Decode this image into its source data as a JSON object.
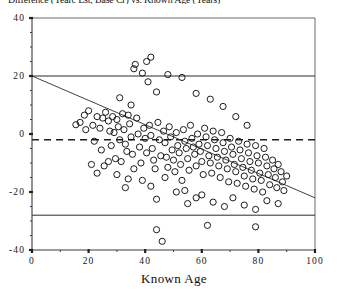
{
  "figure": {
    "clipped_top_title": "Difference (Yearc Est, Base Cr) vs. Known Age (Years)",
    "background": "#ffffff",
    "ink_color": "#111111"
  },
  "chart_data": {
    "type": "scatter",
    "title": "",
    "xlabel": "Known Age",
    "ylabel": "",
    "xlim": [
      0,
      100
    ],
    "xticks": [
      0,
      20,
      40,
      60,
      80,
      100
    ],
    "xtick_labels": [
      "0",
      "20",
      "40",
      "60",
      "80",
      "100"
    ],
    "ylim": [
      -40,
      40
    ],
    "yticks": [
      -40,
      -20,
      0,
      20,
      40
    ],
    "ytick_labels": [
      "-40",
      "-20",
      "0",
      "20",
      "40"
    ],
    "x_minor_tick_step": 10,
    "y_minor_tick_step": 5,
    "grid": false,
    "legend": null,
    "reference_lines": [
      {
        "name": "upper-limit-line",
        "style": "solid",
        "orientation": "horizontal",
        "y": 20
      },
      {
        "name": "mean-bias-line",
        "style": "dashed",
        "orientation": "horizontal",
        "y": -2
      },
      {
        "name": "lower-limit-line",
        "style": "solid",
        "orientation": "horizontal",
        "y": -28
      }
    ],
    "fit_line": {
      "name": "regression-line",
      "style": "solid",
      "x0": 0,
      "y0": 20,
      "x1": 100,
      "y1": -22,
      "slope": -0.42,
      "intercept": 20
    },
    "marker": {
      "shape": "open-circle",
      "radius_px": 3.1
    },
    "n_points": 168,
    "points": [
      [
        15.5,
        3.2
      ],
      [
        17.0,
        4.0
      ],
      [
        18.5,
        6.5
      ],
      [
        19.0,
        1.5
      ],
      [
        20.0,
        8.0
      ],
      [
        21.5,
        3.0
      ],
      [
        22.0,
        -2.5
      ],
      [
        23.0,
        6.0
      ],
      [
        24.0,
        2.0
      ],
      [
        24.5,
        -5.5
      ],
      [
        25.0,
        5.5
      ],
      [
        26.0,
        7.5
      ],
      [
        27.0,
        4.5
      ],
      [
        27.5,
        1.0
      ],
      [
        28.0,
        -4.0
      ],
      [
        28.5,
        6.0
      ],
      [
        29.0,
        0.5
      ],
      [
        29.5,
        -8.5
      ],
      [
        30.0,
        5.0
      ],
      [
        30.5,
        2.5
      ],
      [
        31.0,
        -2.0
      ],
      [
        31.5,
        -9.5
      ],
      [
        32.0,
        7.0
      ],
      [
        32.5,
        1.5
      ],
      [
        33.0,
        -3.5
      ],
      [
        33.5,
        -6.0
      ],
      [
        34.0,
        6.5
      ],
      [
        34.5,
        3.5
      ],
      [
        35.0,
        -1.0
      ],
      [
        35.5,
        -7.0
      ],
      [
        36.0,
        22.5
      ],
      [
        36.5,
        24.0
      ],
      [
        37.0,
        5.5
      ],
      [
        37.5,
        0.0
      ],
      [
        38.0,
        -4.5
      ],
      [
        38.5,
        -10.0
      ],
      [
        39.0,
        21.0
      ],
      [
        39.5,
        2.0
      ],
      [
        40.0,
        -1.5
      ],
      [
        40.5,
        -6.5
      ],
      [
        41.0,
        18.0
      ],
      [
        41.5,
        3.0
      ],
      [
        42.0,
        -0.5
      ],
      [
        42.5,
        -5.0
      ],
      [
        43.0,
        -9.0
      ],
      [
        43.5,
        -12.0
      ],
      [
        44.0,
        14.5
      ],
      [
        44.5,
        4.0
      ],
      [
        45.0,
        -2.0
      ],
      [
        45.5,
        -7.5
      ],
      [
        46.0,
        -37.0
      ],
      [
        46.5,
        1.0
      ],
      [
        47.0,
        -3.0
      ],
      [
        47.5,
        -8.0
      ],
      [
        48.0,
        -11.5
      ],
      [
        48.5,
        2.5
      ],
      [
        49.0,
        -1.0
      ],
      [
        49.5,
        -5.5
      ],
      [
        50.0,
        -9.0
      ],
      [
        50.5,
        -13.0
      ],
      [
        51.0,
        0.5
      ],
      [
        51.5,
        -4.0
      ],
      [
        52.0,
        -6.5
      ],
      [
        52.5,
        -10.5
      ],
      [
        53.0,
        -16.0
      ],
      [
        53.5,
        1.5
      ],
      [
        54.0,
        -2.5
      ],
      [
        54.5,
        -5.0
      ],
      [
        55.0,
        -8.5
      ],
      [
        55.5,
        -12.5
      ],
      [
        56.0,
        3.0
      ],
      [
        56.5,
        -1.5
      ],
      [
        57.0,
        -4.5
      ],
      [
        57.5,
        -7.0
      ],
      [
        58.0,
        -11.0
      ],
      [
        58.5,
        0.0
      ],
      [
        59.0,
        -3.5
      ],
      [
        59.5,
        -6.0
      ],
      [
        60.0,
        -9.5
      ],
      [
        60.5,
        -14.0
      ],
      [
        61.0,
        2.0
      ],
      [
        61.5,
        -1.0
      ],
      [
        62.0,
        -4.0
      ],
      [
        62.5,
        -7.5
      ],
      [
        63.0,
        -10.0
      ],
      [
        63.5,
        -13.5
      ],
      [
        64.0,
        1.0
      ],
      [
        64.5,
        -2.0
      ],
      [
        65.0,
        -5.0
      ],
      [
        65.5,
        -8.0
      ],
      [
        66.0,
        -11.0
      ],
      [
        66.5,
        -15.0
      ],
      [
        67.0,
        0.5
      ],
      [
        67.5,
        -3.0
      ],
      [
        68.0,
        -6.0
      ],
      [
        68.5,
        -9.0
      ],
      [
        69.0,
        -12.0
      ],
      [
        69.5,
        -16.5
      ],
      [
        70.0,
        -1.5
      ],
      [
        70.5,
        -4.5
      ],
      [
        71.0,
        -7.0
      ],
      [
        71.5,
        -10.5
      ],
      [
        72.0,
        -13.0
      ],
      [
        72.5,
        -17.0
      ],
      [
        73.0,
        -2.5
      ],
      [
        73.5,
        -5.5
      ],
      [
        74.0,
        -8.5
      ],
      [
        74.5,
        -11.5
      ],
      [
        75.0,
        -14.5
      ],
      [
        75.5,
        -18.0
      ],
      [
        76.0,
        -3.5
      ],
      [
        76.5,
        -6.5
      ],
      [
        77.0,
        -9.5
      ],
      [
        77.5,
        -12.5
      ],
      [
        78.0,
        -15.5
      ],
      [
        78.5,
        -19.0
      ],
      [
        79.0,
        -4.0
      ],
      [
        79.5,
        -7.5
      ],
      [
        80.0,
        -10.0
      ],
      [
        80.5,
        -13.5
      ],
      [
        81.0,
        -16.0
      ],
      [
        81.5,
        -20.0
      ],
      [
        82.0,
        -5.0
      ],
      [
        82.5,
        -8.0
      ],
      [
        83.0,
        -11.0
      ],
      [
        83.5,
        -14.0
      ],
      [
        84.0,
        -17.5
      ],
      [
        85.0,
        -9.0
      ],
      [
        85.5,
        -12.0
      ],
      [
        86.0,
        -15.0
      ],
      [
        86.5,
        -18.5
      ],
      [
        87.0,
        -10.5
      ],
      [
        88.0,
        -13.0
      ],
      [
        88.5,
        -16.5
      ],
      [
        89.0,
        -19.5
      ],
      [
        90.0,
        -14.5
      ],
      [
        33.0,
        -18.5
      ],
      [
        44.0,
        -22.5
      ],
      [
        54.0,
        -19.5
      ],
      [
        58.0,
        -22.0
      ],
      [
        36.0,
        -12.0
      ],
      [
        27.0,
        -9.5
      ],
      [
        25.5,
        -11.0
      ],
      [
        23.0,
        -13.5
      ],
      [
        21.0,
        -10.5
      ],
      [
        30.0,
        -14.0
      ],
      [
        34.0,
        -15.5
      ],
      [
        39.0,
        -16.0
      ],
      [
        42.0,
        -18.0
      ],
      [
        47.0,
        -15.0
      ],
      [
        51.0,
        -20.0
      ],
      [
        55.0,
        -24.0
      ],
      [
        60.0,
        -21.0
      ],
      [
        64.0,
        -23.5
      ],
      [
        68.0,
        -25.0
      ],
      [
        71.0,
        -22.0
      ],
      [
        75.0,
        -24.5
      ],
      [
        79.0,
        -26.0
      ],
      [
        83.0,
        -23.0
      ],
      [
        87.0,
        -24.0
      ],
      [
        62.0,
        -31.5
      ],
      [
        79.0,
        -32.0
      ],
      [
        44.0,
        -33.0
      ],
      [
        40.5,
        25.0
      ],
      [
        42.0,
        26.5
      ],
      [
        48.0,
        20.5
      ],
      [
        53.0,
        19.5
      ],
      [
        58.0,
        14.0
      ],
      [
        63.0,
        12.0
      ],
      [
        67.5,
        9.5
      ],
      [
        72.0,
        6.0
      ],
      [
        76.0,
        3.0
      ],
      [
        31.0,
        12.5
      ],
      [
        35.0,
        10.0
      ]
    ]
  }
}
